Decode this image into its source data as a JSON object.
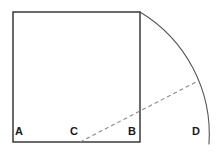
{
  "figure": {
    "type": "geometry-diagram",
    "canvas": {
      "width": 220,
      "height": 155
    },
    "colors": {
      "background": "#ffffff",
      "stroke": "#2b2b2b",
      "arc_stroke": "#555555",
      "dashed_stroke": "#8a8a8a",
      "label_color": "#1a1a1a"
    },
    "square": {
      "name": "square-ABtop",
      "x": 13,
      "y": 12,
      "width": 127,
      "height": 130,
      "stroke_width": 1.4
    },
    "arc": {
      "name": "quarter-arc-from-top-right-to-D",
      "center_label": "C",
      "center": {
        "x": 80,
        "y": 142
      },
      "radius": 143,
      "start": {
        "x": 140,
        "y": 12
      },
      "end": {
        "x": 209,
        "y": 144
      },
      "stroke_width": 1.1,
      "dashed": false
    },
    "segment": {
      "name": "dashed-segment-C-to-arc",
      "from": {
        "x": 80,
        "y": 142
      },
      "to": {
        "x": 198,
        "y": 81
      },
      "stroke_width": 1.1,
      "dash_pattern": "4 3"
    },
    "labels": [
      {
        "id": "A",
        "text": "A",
        "x": 15,
        "y": 126,
        "point": {
          "x": 13,
          "y": 142
        }
      },
      {
        "id": "C",
        "text": "C",
        "x": 70,
        "y": 126,
        "point": {
          "x": 80,
          "y": 142
        }
      },
      {
        "id": "B",
        "text": "B",
        "x": 128,
        "y": 126,
        "point": {
          "x": 140,
          "y": 142
        }
      },
      {
        "id": "D",
        "text": "D",
        "x": 192,
        "y": 126,
        "point": {
          "x": 209,
          "y": 144
        }
      }
    ]
  }
}
